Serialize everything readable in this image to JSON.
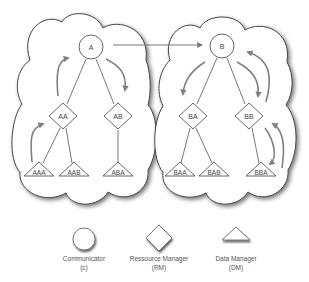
{
  "diagram": {
    "colors": {
      "stroke": "#555555",
      "flow_arrow": "#808080",
      "background": "#ffffff",
      "cloud_shadow": "#9a9a9a"
    },
    "clusters": [
      {
        "name": "left-cluster",
        "communicator": "A",
        "resource_managers": [
          {
            "label": "AA",
            "data_managers": [
              "AAA",
              "AAB"
            ]
          },
          {
            "label": "AB",
            "data_managers": [
              "ABA"
            ]
          }
        ]
      },
      {
        "name": "right-cluster",
        "communicator": "B",
        "resource_managers": [
          {
            "label": "BA",
            "data_managers": [
              "BAA",
              "BAB"
            ]
          },
          {
            "label": "BB",
            "data_managers": [
              "BBA"
            ]
          }
        ]
      }
    ],
    "nodes": {
      "A": "A",
      "B": "B",
      "AA": "AA",
      "AB": "AB",
      "BA": "BA",
      "BB": "BB",
      "AAA": "AAA",
      "AAB": "AAB",
      "ABA": "ABA",
      "BAA": "BAA",
      "BAB": "BAB",
      "BBA": "BBA"
    },
    "connections": [
      {
        "from": "A",
        "to": "B",
        "type": "message-arrow"
      },
      {
        "from": "AAA",
        "to": "AA",
        "type": "flow"
      },
      {
        "from": "AA",
        "to": "A",
        "type": "flow"
      },
      {
        "from": "A",
        "to": "AB",
        "type": "flow"
      },
      {
        "from": "B",
        "to": "BA",
        "type": "flow"
      },
      {
        "from": "B",
        "to": "BB",
        "type": "flow"
      },
      {
        "from": "BB",
        "to": "BBA",
        "type": "flow"
      },
      {
        "from": "BBA",
        "to": "BB",
        "type": "flow"
      },
      {
        "from": "BB",
        "to": "B",
        "type": "flow"
      }
    ]
  },
  "legend": {
    "items": [
      {
        "shape": "circle",
        "line1": "Communicator",
        "line2": "(c)"
      },
      {
        "shape": "diamond",
        "line1": "Ressource Manager",
        "line2": "(RM)"
      },
      {
        "shape": "triangle",
        "line1": "Data Manager",
        "line2": "(DM)"
      }
    ]
  }
}
